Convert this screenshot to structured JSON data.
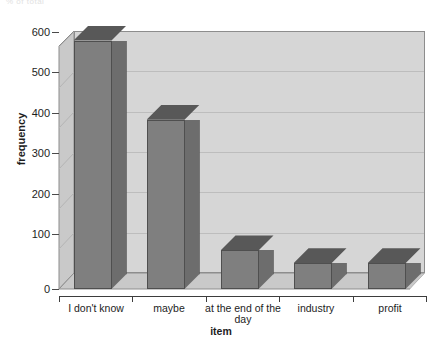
{
  "page": {
    "top_clipped_text": "% of total"
  },
  "chart_data": {
    "type": "bar",
    "title": "",
    "xlabel": "item",
    "ylabel": "frequency",
    "categories": [
      "I don't know",
      "maybe",
      "at the end of the day",
      "industry",
      "profit"
    ],
    "values": [
      580,
      395,
      90,
      60,
      60
    ],
    "ylim": [
      0,
      600
    ],
    "yticks": [
      0,
      100,
      200,
      300,
      400,
      500,
      600
    ],
    "ytick_labels": [
      "0",
      "100",
      "200",
      "300",
      "400",
      "500",
      "600"
    ],
    "grid": true,
    "legend": "none",
    "style": "3d-bar",
    "colors": {
      "bar_front": "#7f7f7f",
      "bar_top": "#585858",
      "bar_side": "#6d6d6d",
      "wall": "#d6d6d6",
      "floor": "#c9c9c9",
      "gridline": "#bdbdbd",
      "axis": "#3d3d3d",
      "background": "#ffffff"
    }
  }
}
